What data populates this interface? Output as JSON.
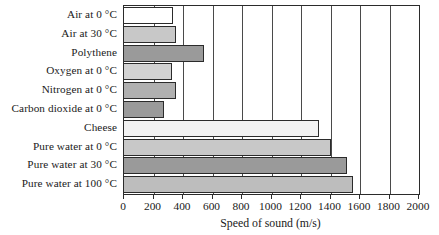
{
  "chart_data": {
    "type": "bar",
    "orientation": "horizontal",
    "title": "",
    "xlabel": "Speed of sound (m/s)",
    "ylabel": "",
    "xlim": [
      0,
      2000
    ],
    "xticks": [
      0,
      200,
      400,
      600,
      800,
      1000,
      1200,
      1400,
      1600,
      1800,
      2000
    ],
    "grid": true,
    "grid_axis": "x",
    "legend": false,
    "categories": [
      "Air at 0 °C",
      "Air at 30 °C",
      "Polythene",
      "Oxygen at 0 °C",
      "Nitrogen at 0 °C",
      "Carbon dioxide at 0 °C",
      "Cheese",
      "Pure water at 0 °C",
      "Pure water at 30 °C",
      "Pure water at 100 °C"
    ],
    "values": [
      330,
      350,
      540,
      325,
      350,
      270,
      1320,
      1400,
      1510,
      1555
    ],
    "bar_colors": [
      "#ffffff",
      "#c8c8c8",
      "#9a9a9a",
      "#d2d2d2",
      "#b0b0b0",
      "#9a9a9a",
      "#f2f2f2",
      "#c8c8c8",
      "#9a9a9a",
      "#bdbdbd"
    ],
    "bar_edge_color": "#2b2b2b",
    "axis_color": "#2b2b2b",
    "grid_color": "#4a4a4a",
    "background_color": "#ffffff"
  }
}
